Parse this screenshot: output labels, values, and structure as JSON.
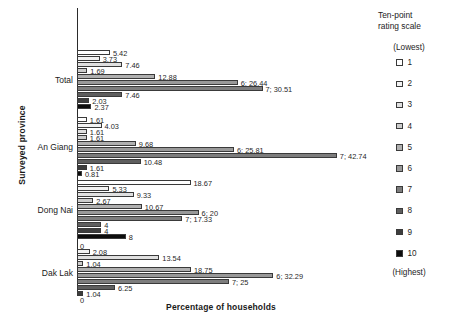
{
  "chart_data": {
    "type": "bar",
    "orientation": "horizontal",
    "title": "",
    "xlabel": "Percentage of households",
    "ylabel": "Surveyed province",
    "categories": [
      "Total",
      "An Giang",
      "Dong Nai",
      "Dak Lak"
    ],
    "xlim": [
      0,
      45
    ],
    "grid": false,
    "legend_position": "right",
    "legend_title": "Ten-point rating scale",
    "legend_lowest": "(Lowest)",
    "legend_highest": "(Highest)",
    "series": [
      {
        "name": "1",
        "swatch": "#ffffff",
        "values": [
          5.42,
          1.61,
          18.67,
          0
        ]
      },
      {
        "name": "2",
        "swatch": "#f2f2f2",
        "values": [
          3.73,
          4.03,
          5.33,
          2.08
        ]
      },
      {
        "name": "3",
        "swatch": "#e0e0e0",
        "values": [
          7.46,
          1.61,
          9.33,
          13.54
        ]
      },
      {
        "name": "4",
        "swatch": "#cccccc",
        "values": [
          1.69,
          1.61,
          2.67,
          1.04
        ]
      },
      {
        "name": "5",
        "swatch": "#b0b0b0",
        "values": [
          12.88,
          9.68,
          10.67,
          18.75
        ]
      },
      {
        "name": "6",
        "swatch": "#999999",
        "values": [
          26.44,
          25.81,
          20,
          32.29
        ]
      },
      {
        "name": "7",
        "swatch": "#7d7d7d",
        "values": [
          30.51,
          42.74,
          17.33,
          25
        ]
      },
      {
        "name": "8",
        "swatch": "#5e5e5e",
        "values": [
          7.46,
          10.48,
          4,
          6.25
        ]
      },
      {
        "name": "9",
        "swatch": "#3d3d3d",
        "values": [
          2.03,
          1.61,
          4,
          1.04
        ]
      },
      {
        "name": "10",
        "swatch": "#0d0d0d",
        "values": [
          2.37,
          0.81,
          8,
          0
        ]
      }
    ],
    "value_labels": [
      [
        "5.42",
        "3.73",
        "7.46",
        "1.69",
        "12.88",
        "6; 26.44",
        "7; 30.51",
        "7.46",
        "2.03",
        "2.37"
      ],
      [
        "1.61",
        "4.03",
        "1.61",
        "1.61",
        "9.68",
        "6; 25.81",
        "7; 42.74",
        "10.48",
        "1.61",
        "0.81"
      ],
      [
        "18.67",
        "5.33",
        "9.33",
        "2.67",
        "10.67",
        "6; 20",
        "7; 17.33",
        "4",
        "4",
        "8"
      ],
      [
        "0",
        "2.08",
        "13.54",
        "1.04",
        "18.75",
        "6; 32.29",
        "7; 25",
        "6.25",
        "1.04",
        "0"
      ]
    ]
  },
  "legend": {
    "title_line1": "Ten-point",
    "title_line2": "rating scale",
    "lowest": "(Lowest)",
    "highest": "(Highest)"
  }
}
